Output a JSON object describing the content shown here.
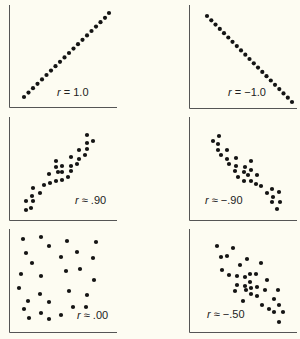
{
  "chart_data": [
    {
      "type": "scatter",
      "title": "",
      "annotation": "r = 1.0",
      "r": 1.0,
      "axes": {
        "x": [
          9,
          117
        ],
        "y": [
          5,
          107
        ]
      },
      "label_pos": [
        57,
        96
      ],
      "points": [
        [
          24,
          97
        ],
        [
          28.5,
          92.6
        ],
        [
          33,
          88.2
        ],
        [
          37.5,
          83.8
        ],
        [
          42,
          79.4
        ],
        [
          46.5,
          75
        ],
        [
          51,
          70.6
        ],
        [
          55.5,
          66.2
        ],
        [
          60,
          61.8
        ],
        [
          64.5,
          57.4
        ],
        [
          69,
          53
        ],
        [
          73.5,
          48.6
        ],
        [
          78,
          44.2
        ],
        [
          82.5,
          39.8
        ],
        [
          87,
          35.4
        ],
        [
          91.5,
          31
        ],
        [
          96,
          26.6
        ],
        [
          100.5,
          22.2
        ],
        [
          105,
          17.8
        ],
        [
          109,
          13
        ]
      ]
    },
    {
      "type": "scatter",
      "title": "",
      "annotation": "r = −1.0",
      "r": -1.0,
      "axes": {
        "x": [
          189,
          297
        ],
        "y": [
          5,
          108
        ]
      },
      "label_pos": [
        228,
        96
      ],
      "points": [
        [
          207,
          16
        ],
        [
          211.3,
          20.3
        ],
        [
          215.5,
          24.6
        ],
        [
          219.8,
          28.9
        ],
        [
          224,
          33.2
        ],
        [
          228.3,
          37.5
        ],
        [
          232.5,
          41.8
        ],
        [
          236.8,
          46.1
        ],
        [
          241,
          50.4
        ],
        [
          245.3,
          54.7
        ],
        [
          249.5,
          59
        ],
        [
          253.8,
          63.3
        ],
        [
          258,
          67.6
        ],
        [
          262.3,
          71.9
        ],
        [
          266.5,
          76.2
        ],
        [
          270.8,
          80.5
        ],
        [
          275,
          84.8
        ],
        [
          279.3,
          89.1
        ],
        [
          283.5,
          93.4
        ],
        [
          287.8,
          97.7
        ],
        [
          292,
          102
        ]
      ]
    },
    {
      "type": "scatter",
      "title": "",
      "annotation": "r ≈ .90",
      "r": 0.9,
      "axes": {
        "x": [
          9,
          117
        ],
        "y": [
          117,
          220
        ]
      },
      "label_pos": [
        75,
        204
      ],
      "points": [
        [
          87,
          135
        ],
        [
          93,
          141
        ],
        [
          87,
          143
        ],
        [
          87,
          149
        ],
        [
          79,
          150
        ],
        [
          85,
          155
        ],
        [
          79,
          159
        ],
        [
          71,
          157
        ],
        [
          56,
          161
        ],
        [
          77,
          164
        ],
        [
          71,
          166
        ],
        [
          62,
          166
        ],
        [
          56,
          167
        ],
        [
          58,
          172
        ],
        [
          62,
          172
        ],
        [
          49,
          174
        ],
        [
          71,
          171
        ],
        [
          68,
          177
        ],
        [
          62,
          180
        ],
        [
          56,
          181
        ],
        [
          50,
          183
        ],
        [
          44,
          185
        ],
        [
          33,
          188
        ],
        [
          40,
          193
        ],
        [
          32,
          196
        ],
        [
          26,
          201
        ],
        [
          33,
          201
        ],
        [
          31,
          208
        ],
        [
          26,
          210
        ]
      ]
    },
    {
      "type": "scatter",
      "title": "",
      "annotation": "r ≈ −.90",
      "r": -0.9,
      "axes": {
        "x": [
          189,
          297
        ],
        "y": [
          117,
          220
        ]
      },
      "label_pos": [
        205,
        204
      ],
      "points": [
        [
          213,
          141
        ],
        [
          219,
          136
        ],
        [
          218,
          144
        ],
        [
          218,
          150
        ],
        [
          227,
          150
        ],
        [
          221,
          155
        ],
        [
          227,
          159
        ],
        [
          236,
          158
        ],
        [
          229,
          164
        ],
        [
          236,
          166
        ],
        [
          251,
          161
        ],
        [
          245,
          167
        ],
        [
          235,
          171
        ],
        [
          244,
          172
        ],
        [
          251,
          170
        ],
        [
          238,
          177
        ],
        [
          248,
          175
        ],
        [
          257,
          175
        ],
        [
          244,
          181
        ],
        [
          251,
          181
        ],
        [
          256,
          184
        ],
        [
          261,
          186
        ],
        [
          267,
          193
        ],
        [
          272,
          189
        ],
        [
          279,
          192
        ],
        [
          273,
          197
        ],
        [
          280,
          202
        ],
        [
          272,
          202
        ],
        [
          277,
          209
        ]
      ]
    },
    {
      "type": "scatter",
      "title": "",
      "annotation": "r ≈ .00",
      "r": 0.0,
      "axes": {
        "x": [
          9,
          117
        ],
        "y": [
          229,
          332
        ]
      },
      "label_pos": [
        77,
        319
      ],
      "points": [
        [
          23,
          239
        ],
        [
          41,
          237
        ],
        [
          49,
          246
        ],
        [
          67,
          241
        ],
        [
          96,
          242
        ],
        [
          26,
          253
        ],
        [
          61,
          257
        ],
        [
          77,
          252
        ],
        [
          93,
          258
        ],
        [
          32,
          263
        ],
        [
          21,
          274
        ],
        [
          41,
          276
        ],
        [
          66,
          271
        ],
        [
          80,
          269
        ],
        [
          94,
          280
        ],
        [
          19,
          288
        ],
        [
          40,
          294
        ],
        [
          69,
          291
        ],
        [
          87,
          295
        ],
        [
          28,
          301
        ],
        [
          49,
          302
        ],
        [
          24,
          309
        ],
        [
          73,
          307
        ],
        [
          86,
          307
        ],
        [
          41,
          313
        ],
        [
          29,
          318
        ],
        [
          49,
          319
        ],
        [
          61,
          315
        ]
      ]
    },
    {
      "type": "scatter",
      "title": "",
      "annotation": "r ≈ −.50",
      "r": -0.5,
      "axes": {
        "x": [
          189,
          297
        ],
        "y": [
          229,
          332
        ]
      },
      "label_pos": [
        207,
        318
      ],
      "points": [
        [
          217,
          246
        ],
        [
          233,
          248
        ],
        [
          221,
          257
        ],
        [
          227,
          256
        ],
        [
          247,
          259
        ],
        [
          240,
          265
        ],
        [
          261,
          263
        ],
        [
          222,
          270
        ],
        [
          229,
          275
        ],
        [
          237,
          276
        ],
        [
          245,
          277
        ],
        [
          250,
          274
        ],
        [
          256,
          274
        ],
        [
          267,
          280
        ],
        [
          250,
          282
        ],
        [
          237,
          285
        ],
        [
          245,
          286
        ],
        [
          251,
          288
        ],
        [
          257,
          287
        ],
        [
          235,
          291
        ],
        [
          246,
          290
        ],
        [
          265,
          290
        ],
        [
          278,
          290
        ],
        [
          251,
          294
        ],
        [
          257,
          296
        ],
        [
          274,
          299
        ],
        [
          243,
          301
        ],
        [
          262,
          305
        ],
        [
          279,
          305
        ],
        [
          269,
          309
        ],
        [
          274,
          312
        ],
        [
          283,
          312
        ],
        [
          279,
          322
        ]
      ]
    }
  ]
}
